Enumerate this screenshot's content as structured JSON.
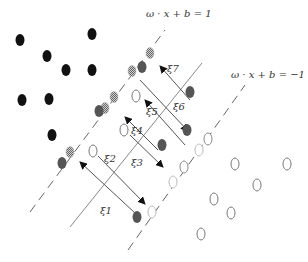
{
  "margin_labels": {
    "positive": "ω · x + b = 1",
    "negative": "ω · x + b = −1"
  },
  "slack_labels": [
    "ξ1",
    "ξ2",
    "ξ3",
    "ξ4",
    "ξ5",
    "ξ6",
    "ξ7"
  ],
  "colors": {
    "class_a_fill": "#111111",
    "misclassified_fill": "#555555",
    "line": "#888888",
    "arrow": "#444444",
    "hollow_stroke": "#777777"
  },
  "points": {
    "class_a": [
      [
        20,
        40
      ],
      [
        92,
        34
      ],
      [
        45,
        55
      ],
      [
        66,
        70
      ],
      [
        92,
        69
      ],
      [
        22,
        100
      ],
      [
        49,
        99
      ],
      [
        52,
        135
      ]
    ],
    "class_b": [
      [
        237,
        163
      ],
      [
        273,
        163
      ],
      [
        210,
        200
      ],
      [
        231,
        213
      ],
      [
        201,
        233
      ],
      [
        240,
        183
      ]
    ],
    "support_a_checkered": [
      [
        70,
        152
      ],
      [
        132,
        72
      ],
      [
        139,
        65
      ],
      [
        117,
        106
      ],
      [
        106,
        88
      ]
    ],
    "support_b_hollow": [
      [
        211,
        140
      ],
      [
        195,
        152
      ],
      [
        177,
        162
      ],
      [
        164,
        175
      ],
      [
        151,
        212
      ]
    ],
    "errors_dark": [
      [
        62,
        163
      ],
      [
        102,
        102
      ],
      [
        126,
        75
      ],
      [
        137,
        212
      ],
      [
        161,
        152
      ],
      [
        190,
        143
      ],
      [
        192,
        105
      ]
    ],
    "errors_hollow": [
      [
        93,
        151
      ],
      [
        129,
        129
      ],
      [
        136,
        116
      ]
    ]
  }
}
